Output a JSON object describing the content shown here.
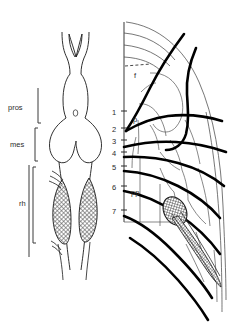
{
  "figure": {
    "title": "",
    "panels": [
      {
        "id": "left-panel",
        "name": "dorsal-view-schematic",
        "region_labels": [
          {
            "key": "pros",
            "text": "pros",
            "x": 10,
            "y": 107
          },
          {
            "key": "mes",
            "text": "mes",
            "x": 12,
            "y": 141
          },
          {
            "key": "rh",
            "text": "rh",
            "x": 19,
            "y": 202
          }
        ]
      },
      {
        "id": "right-panel",
        "name": "lateral-nerve-schematic",
        "axis_ticks": [
          {
            "label": "1",
            "y": 111
          },
          {
            "label": "2",
            "y": 128
          },
          {
            "label": "3",
            "y": 140
          },
          {
            "label": "4",
            "y": 152
          },
          {
            "label": "5",
            "y": 166
          },
          {
            "label": "6",
            "y": 186
          },
          {
            "label": "7",
            "y": 210
          }
        ],
        "inline_labels": [
          {
            "key": "f",
            "text": "f",
            "x": 134,
            "y": 75
          },
          {
            "key": "p",
            "text": "p",
            "x": 133,
            "y": 119
          },
          {
            "key": "pp",
            "text": "pp",
            "x": 132,
            "y": 192
          }
        ]
      }
    ],
    "colors": {
      "background": "#ffffff",
      "ink": "#000000",
      "thin_line": "#3c3c3c",
      "label_text": "#2b2b2b",
      "hatch_fill": "#8a8a8a"
    }
  }
}
